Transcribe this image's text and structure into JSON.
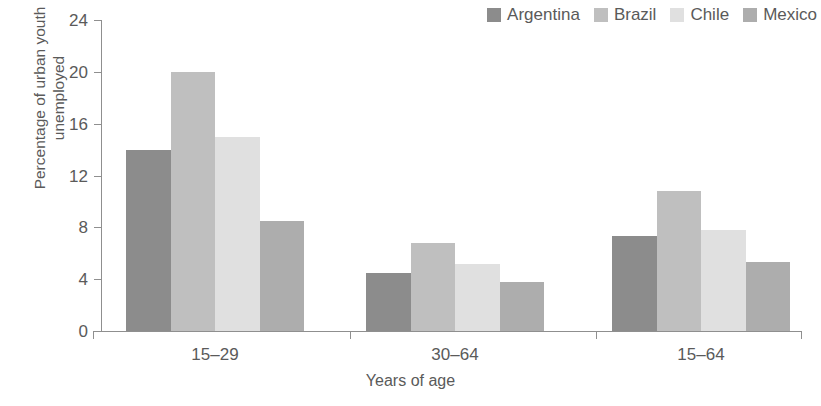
{
  "chart_data": {
    "type": "bar",
    "title": "",
    "xlabel": "Years of age",
    "ylabel": "Percentage of urban youth unemployed",
    "ylabel_line1": "Percentage of urban youth",
    "ylabel_line2": "unemployed",
    "categories": [
      "15–29",
      "30–64",
      "15–64"
    ],
    "yticks": [
      0,
      4,
      8,
      12,
      16,
      20,
      24
    ],
    "ylim": [
      0,
      24
    ],
    "grid": false,
    "legend_position": "top-right",
    "series": [
      {
        "name": "Argentina",
        "color": "#8c8c8c",
        "values": [
          14.0,
          4.5,
          7.3
        ]
      },
      {
        "name": "Brazil",
        "color": "#bfbfbf",
        "values": [
          20.0,
          6.8,
          10.8
        ]
      },
      {
        "name": "Chile",
        "color": "#e0e0e0",
        "values": [
          15.0,
          5.2,
          7.8
        ]
      },
      {
        "name": "Mexico",
        "color": "#adadad",
        "values": [
          8.5,
          3.8,
          5.3
        ]
      }
    ]
  },
  "axis": {
    "tick_labels_y": [
      "24",
      "20",
      "16",
      "12",
      "8",
      "4",
      "0"
    ],
    "tick_labels_x": [
      "15–29",
      "30–64",
      "15–64"
    ]
  },
  "legend": {
    "items": [
      {
        "label": "Argentina",
        "color": "#8c8c8c"
      },
      {
        "label": "Brazil",
        "color": "#bfbfbf"
      },
      {
        "label": "Chile",
        "color": "#e0e0e0"
      },
      {
        "label": "Mexico",
        "color": "#adadad"
      }
    ]
  }
}
